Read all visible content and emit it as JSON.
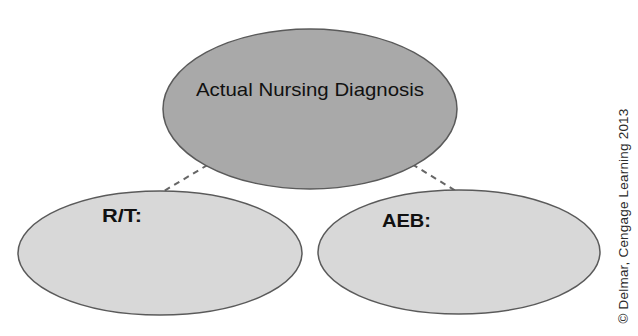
{
  "diagram": {
    "title_node": {
      "label": "Actual Nursing Diagnosis",
      "fill": "#a9a9a9"
    },
    "child_nodes": [
      {
        "label": "R/T:",
        "fill": "#d8d8d8"
      },
      {
        "label": "AEB:",
        "fill": "#d8d8d8"
      }
    ],
    "connectors": {
      "style": "dashed",
      "color": "#666666"
    },
    "outline_color": "#5a5a5a"
  },
  "copyright": "© Delmar, Cengage Learning 2013"
}
